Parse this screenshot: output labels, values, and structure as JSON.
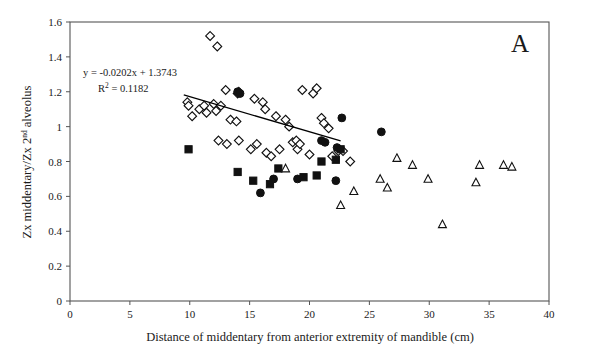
{
  "figure": {
    "panel_label": "A",
    "background_color": "#ffffff",
    "axis_color": "#555555",
    "marker_color": "#111111"
  },
  "annotations": {
    "equation": "y = -0.0202x + 1.3743",
    "r_squared_prefix": "R",
    "r_squared_sup": "2",
    "r_squared_value": " = 0.1182"
  },
  "chart_data": {
    "type": "scatter",
    "title": "",
    "xlabel": "Distance of middentary from anterior extremity of mandible (cm)",
    "ylabel_parts": {
      "before": "Zx middentary/Zx 2",
      "sup": "nd",
      "after": " alveolus"
    },
    "ylabel": "Zx middentary/Zx 2nd alveolus",
    "xlim": [
      0,
      40
    ],
    "ylim": [
      0,
      1.6
    ],
    "xticks": [
      0,
      5,
      10,
      15,
      20,
      25,
      30,
      35,
      40
    ],
    "xtick_labels": [
      "0",
      "5",
      "10",
      "15",
      "20",
      "25",
      "30",
      "35",
      "40"
    ],
    "yticks": [
      0,
      0.2,
      0.4,
      0.6,
      0.8,
      1,
      1.2,
      1.4,
      1.6
    ],
    "ytick_labels": [
      "0",
      "0.2",
      "0.4",
      "0.6",
      "0.8",
      "1",
      "1.2",
      "1.4",
      "1.6"
    ],
    "grid": false,
    "legend": "none",
    "trendline": {
      "equation": "y = -0.0202x + 1.3743",
      "slope": -0.0202,
      "intercept": 1.3743,
      "r_squared": 0.1182,
      "x_start": 9.5,
      "x_end": 22.6
    },
    "series": [
      {
        "name": "open-diamond",
        "marker": "diamond",
        "filled": false,
        "points": [
          [
            11.7,
            1.52
          ],
          [
            12.3,
            1.46
          ],
          [
            13.0,
            1.21
          ],
          [
            14.0,
            1.19
          ],
          [
            14.1,
            1.2
          ],
          [
            15.4,
            1.16
          ],
          [
            16.1,
            1.14
          ],
          [
            16.3,
            1.1
          ],
          [
            9.8,
            1.14
          ],
          [
            9.9,
            1.12
          ],
          [
            10.2,
            1.06
          ],
          [
            10.8,
            1.1
          ],
          [
            11.2,
            1.12
          ],
          [
            11.4,
            1.08
          ],
          [
            12.0,
            1.13
          ],
          [
            12.2,
            1.09
          ],
          [
            12.6,
            1.12
          ],
          [
            13.4,
            1.04
          ],
          [
            13.9,
            1.03
          ],
          [
            17.2,
            1.06
          ],
          [
            18.0,
            1.04
          ],
          [
            18.3,
            1.0
          ],
          [
            19.4,
            1.21
          ],
          [
            20.3,
            1.19
          ],
          [
            20.6,
            1.22
          ],
          [
            21.0,
            1.05
          ],
          [
            21.2,
            1.02
          ],
          [
            21.6,
            0.99
          ],
          [
            12.4,
            0.92
          ],
          [
            13.1,
            0.9
          ],
          [
            14.1,
            0.92
          ],
          [
            15.1,
            0.87
          ],
          [
            15.6,
            0.9
          ],
          [
            16.4,
            0.85
          ],
          [
            16.8,
            0.83
          ],
          [
            17.5,
            0.87
          ],
          [
            18.6,
            0.91
          ],
          [
            19.0,
            0.87
          ],
          [
            20.0,
            0.84
          ],
          [
            21.9,
            0.83
          ],
          [
            22.4,
            0.86
          ],
          [
            22.8,
            0.86
          ],
          [
            23.4,
            0.8
          ],
          [
            18.9,
            0.92
          ],
          [
            19.2,
            0.9
          ]
        ]
      },
      {
        "name": "filled-circle",
        "marker": "circle",
        "filled": true,
        "points": [
          [
            14.0,
            1.2
          ],
          [
            14.2,
            1.19
          ],
          [
            21.0,
            0.92
          ],
          [
            21.3,
            0.91
          ],
          [
            22.7,
            1.05
          ],
          [
            26.0,
            0.97
          ],
          [
            15.9,
            0.62
          ],
          [
            17.0,
            0.7
          ],
          [
            19.0,
            0.7
          ],
          [
            22.2,
            0.69
          ],
          [
            22.3,
            0.88
          ]
        ]
      },
      {
        "name": "filled-square",
        "marker": "square",
        "filled": true,
        "points": [
          [
            9.9,
            0.87
          ],
          [
            14.0,
            0.74
          ],
          [
            15.3,
            0.69
          ],
          [
            16.7,
            0.67
          ],
          [
            17.4,
            0.76
          ],
          [
            19.5,
            0.71
          ],
          [
            20.6,
            0.72
          ],
          [
            21.0,
            0.8
          ],
          [
            22.2,
            0.81
          ],
          [
            22.6,
            0.87
          ]
        ]
      },
      {
        "name": "open-triangle",
        "marker": "triangle",
        "filled": false,
        "points": [
          [
            18.0,
            0.76
          ],
          [
            22.6,
            0.55
          ],
          [
            25.9,
            0.7
          ],
          [
            26.5,
            0.65
          ],
          [
            27.3,
            0.82
          ],
          [
            28.6,
            0.78
          ],
          [
            29.9,
            0.7
          ],
          [
            31.1,
            0.44
          ],
          [
            33.9,
            0.68
          ],
          [
            34.2,
            0.78
          ],
          [
            36.2,
            0.78
          ],
          [
            36.9,
            0.77
          ],
          [
            23.7,
            0.63
          ]
        ]
      }
    ]
  }
}
